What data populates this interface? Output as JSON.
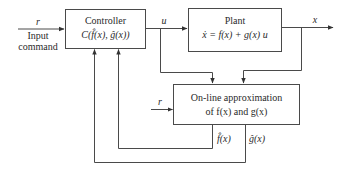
{
  "diagram": {
    "type": "block-diagram",
    "blocks": {
      "controller": {
        "title": "Controller",
        "formula": "C(f̂(x), ĝ(x))"
      },
      "plant": {
        "title": "Plant",
        "formula": "ẋ = f(x) + g(x) u"
      },
      "approximator": {
        "line1": "On-line approximation",
        "line2": "of f(x) and g(x)"
      }
    },
    "signals": {
      "input_symbol": "r",
      "input_label_line1": "Input",
      "input_label_line2": "command",
      "control_symbol": "u",
      "state_symbol": "x",
      "approx_input_symbol": "r",
      "f_hat": "f̂(x)",
      "g_hat": "ĝ(x)"
    }
  }
}
